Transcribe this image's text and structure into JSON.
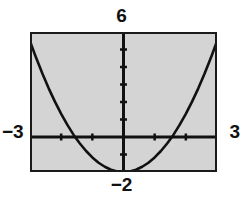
{
  "figure": {
    "kind": "graphing-calculator-window",
    "labels": {
      "top": "6",
      "bottom": "−2",
      "left": "−3",
      "right": "3"
    },
    "colors": {
      "plot_background": "#d4d4d4",
      "frame": "#1a1a1a",
      "axis": "#111111",
      "curve": "#111111",
      "page_background": "#ffffff"
    }
  },
  "chart_data": {
    "type": "line",
    "title": "",
    "xlabel": "",
    "ylabel": "",
    "xlim": [
      -3,
      3
    ],
    "ylim": [
      -2,
      6
    ],
    "grid": false,
    "legend": null,
    "x_tick_labels": [
      "−3",
      "3"
    ],
    "y_tick_labels": [
      "−2",
      "6"
    ],
    "x_ticks": [
      -2,
      -1,
      1,
      2
    ],
    "y_ticks": [
      -1,
      1,
      2,
      3,
      4,
      5
    ],
    "tick_label_positions": {
      "x_min_label": "−3",
      "x_max_label": "3",
      "y_max_label": "6",
      "y_min_label": "−2"
    },
    "series": [
      {
        "name": "parabola",
        "equation": "y = 0.83x^2 - 2",
        "vertex": [
          0,
          -2
        ],
        "x_intercepts": [
          -1.55,
          1.55
        ],
        "x": [
          -3.0,
          -2.8,
          -2.6,
          -2.4,
          -2.2,
          -2.0,
          -1.8,
          -1.6,
          -1.4,
          -1.2,
          -1.0,
          -0.8,
          -0.6,
          -0.4,
          -0.2,
          0.0,
          0.2,
          0.4,
          0.6,
          0.8,
          1.0,
          1.2,
          1.4,
          1.6,
          1.8,
          2.0,
          2.2,
          2.4,
          2.6,
          2.8,
          3.0
        ],
        "y": [
          5.47,
          4.51,
          3.61,
          2.78,
          2.02,
          1.32,
          0.69,
          0.12,
          -0.37,
          -0.8,
          -1.17,
          -1.47,
          -1.7,
          -1.87,
          -1.97,
          -2.0,
          -1.97,
          -1.87,
          -1.7,
          -1.47,
          -1.17,
          -0.8,
          -0.37,
          0.12,
          0.69,
          1.32,
          2.02,
          2.78,
          3.61,
          4.51,
          5.47
        ]
      }
    ]
  }
}
